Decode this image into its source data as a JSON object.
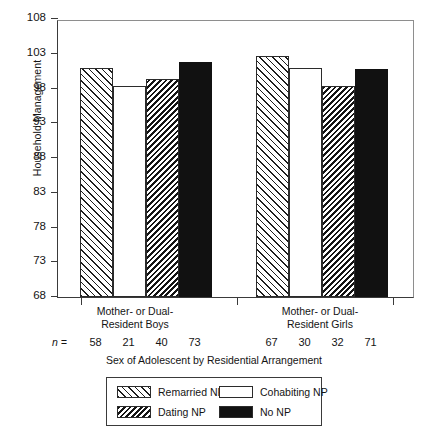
{
  "chart_data": {
    "type": "bar",
    "title": "",
    "xlabel": "Sex of Adolescent by Residential Arrangement",
    "ylabel": "Household Management",
    "ylim": [
      68,
      108
    ],
    "yticks": [
      68,
      73,
      78,
      83,
      88,
      93,
      98,
      103,
      108
    ],
    "grid": false,
    "legend_position": "bottom",
    "categories": [
      "Mother- or Dual-Resident Boys",
      "Mother- or Dual-Resident Girls"
    ],
    "series": [
      {
        "name": "Remarried NP",
        "values": [
          100.9,
          102.7
        ],
        "n": [
          58,
          67
        ],
        "pattern": "diagonal-hatch-up"
      },
      {
        "name": "Cohabiting NP",
        "values": [
          98.3,
          101.0
        ],
        "n": [
          21,
          30
        ],
        "pattern": "solid-white"
      },
      {
        "name": "Dating NP",
        "values": [
          99.3,
          98.3
        ],
        "n": [
          40,
          32
        ],
        "pattern": "dense-hatch-down"
      },
      {
        "name": "No NP",
        "values": [
          101.8,
          100.8
        ],
        "n": [
          73,
          71
        ],
        "pattern": "solid-black"
      }
    ],
    "n_row_label": "n ="
  },
  "axis": {
    "y_title": "Household Management",
    "x_title": "Sex of Adolescent by Residential Arrangement",
    "y_ticks": [
      "108",
      "103",
      "98",
      "93",
      "88",
      "83",
      "78",
      "73",
      "68"
    ]
  },
  "groups": [
    {
      "line1": "Mother- or Dual-",
      "line2": "Resident Boys",
      "n": [
        "58",
        "21",
        "40",
        "73"
      ]
    },
    {
      "line1": "Mother- or Dual-",
      "line2": "Resident Girls",
      "n": [
        "67",
        "30",
        "32",
        "71"
      ]
    }
  ],
  "n_label": "n =",
  "legend": {
    "items": [
      {
        "label": "Remarried NP",
        "swatch": "diagonal-hatch-up-swatch"
      },
      {
        "label": "Cohabiting NP",
        "swatch": "white-swatch"
      },
      {
        "label": "Dating NP",
        "swatch": "dense-hatch-down-swatch"
      },
      {
        "label": "No NP",
        "swatch": "black-swatch"
      }
    ]
  },
  "colors": {
    "axis": "#3a3a3a",
    "frame": "#8e8e8e",
    "bar_outline": "#2b2b2b",
    "no_np_fill": "#111111",
    "hatch": "#1d1d1d"
  }
}
